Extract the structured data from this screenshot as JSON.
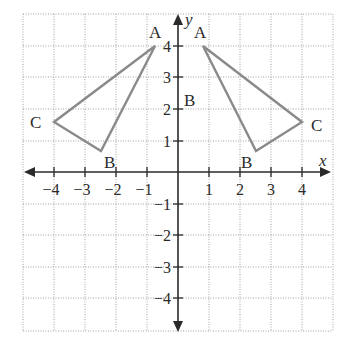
{
  "figure": {
    "type": "coordinate-plane",
    "x_axis_label": "x",
    "y_axis_label": "y",
    "x_tick_labels": [
      "−4",
      "−3",
      "−2",
      "−1",
      "1",
      "2",
      "3",
      "4"
    ],
    "y_tick_labels": [
      "4",
      "3",
      "2",
      "1",
      "−1",
      "−2",
      "−3",
      "−4"
    ],
    "grid_range": {
      "x": [
        -5,
        5
      ],
      "y": [
        -5,
        5
      ]
    },
    "extra_label": "B",
    "colors": {
      "axis": "#2a2a2a",
      "grid": "#9a9a9a",
      "triangle": "#8a8a8a"
    }
  },
  "triangles": [
    {
      "name": "left-triangle",
      "vertices": [
        {
          "label": "A",
          "x": -0.75,
          "y": 4
        },
        {
          "label": "B",
          "x": -2.5,
          "y": 0.67
        },
        {
          "label": "C",
          "x": -4,
          "y": 1.6
        }
      ]
    },
    {
      "name": "right-triangle",
      "vertices": [
        {
          "label": "A",
          "x": 0.8,
          "y": 4
        },
        {
          "label": "B",
          "x": 2.5,
          "y": 0.67
        },
        {
          "label": "C",
          "x": 4,
          "y": 1.6
        }
      ]
    }
  ]
}
